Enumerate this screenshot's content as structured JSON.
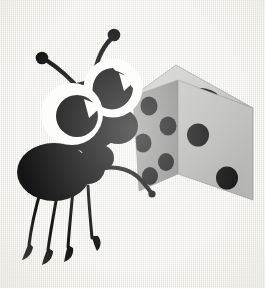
{
  "canvas": {
    "width": 265,
    "height": 288,
    "background_color": "#f5f4f0",
    "texture": "linen-weave"
  },
  "illustration": {
    "title": "Cartoon ant pushing a die",
    "subject": "ant",
    "style": "flat vector clip-art",
    "ink_color": "#141414",
    "eye_white_color": "#fdfdfb"
  },
  "ant": {
    "label": "cartoon ant",
    "body_color": "#141414",
    "parts": {
      "head_label": "ant head",
      "abdomen_label": "ant abdomen",
      "thorax_label": "ant thorax",
      "arm_label": "ant arm",
      "leg_count": 4,
      "antenna_count": 2,
      "eye_count": 2
    },
    "eyes": [
      {
        "name": "left-eye",
        "cx": 73,
        "cy": 112,
        "r": 30,
        "pupil_cx": 78,
        "pupil_cy": 115,
        "pupil_r": 21,
        "highlight_angle": 40
      },
      {
        "name": "right-eye",
        "cx": 113,
        "cy": 88,
        "r": 29,
        "pupil_cx": 117,
        "pupil_cy": 90,
        "pupil_r": 20,
        "highlight_angle": 40
      }
    ],
    "legs": [
      {
        "name": "leg-1",
        "tip_x": 30,
        "tip_y": 250
      },
      {
        "name": "leg-2",
        "tip_x": 48,
        "tip_y": 256
      },
      {
        "name": "leg-3",
        "tip_x": 68,
        "tip_y": 252
      },
      {
        "name": "leg-4",
        "tip_x": 92,
        "tip_y": 243
      }
    ],
    "antennae": [
      {
        "name": "antenna-left",
        "tip_x": 41,
        "tip_y": 57,
        "tip_r": 6
      },
      {
        "name": "antenna-right",
        "tip_x": 114,
        "tip_y": 33,
        "tip_r": 6
      }
    ]
  },
  "die": {
    "label": "six-sided die",
    "face_colors": {
      "top": "#c9c9c7",
      "front": "#bdbdbb",
      "left": "#9a9a98"
    },
    "pip_color": "#1b1b1b",
    "faces": [
      {
        "name": "die-face-top",
        "visible_pips": 1,
        "shade": "light",
        "pips": [
          {
            "x": 202,
            "y": 97
          }
        ]
      },
      {
        "name": "die-face-front",
        "visible_pips": 2,
        "shade": "medium",
        "pips": [
          {
            "x": 196,
            "y": 135
          },
          {
            "x": 225,
            "y": 177
          }
        ]
      },
      {
        "name": "die-face-left",
        "visible_pips": 5,
        "shade": "dark",
        "pips": [
          {
            "x": 149,
            "y": 106
          },
          {
            "x": 168,
            "y": 126
          },
          {
            "x": 143,
            "y": 142
          },
          {
            "x": 163,
            "y": 161
          },
          {
            "x": 152,
            "y": 174
          }
        ]
      }
    ]
  }
}
